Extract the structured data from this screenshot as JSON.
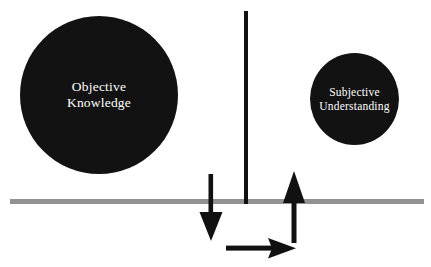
{
  "diagram": {
    "background_color": "#ffffff",
    "nodes": [
      {
        "id": "objective-knowledge",
        "label_line1": "Objective",
        "label_line2": "Knowledge",
        "shape": "circle",
        "fill_color": "#121212",
        "text_color": "#ffffff",
        "center_x": 99,
        "center_y": 95,
        "diameter": 158
      },
      {
        "id": "subjective-understanding",
        "label_line1": "Subjective",
        "label_line2": "Understanding",
        "shape": "circle",
        "fill_color": "#121212",
        "text_color": "#ffffff",
        "center_x": 354,
        "center_y": 99,
        "diameter": 90
      }
    ],
    "ground_line": {
      "name": "horizontal-boundary-line",
      "color": "#929292",
      "x_start": 10,
      "x_end": 424,
      "y": 201,
      "thickness": 5
    },
    "barrier": {
      "name": "vertical-divider-bar",
      "color": "#111111",
      "x": 246,
      "y_top": 11,
      "y_bottom": 204,
      "thickness": 4
    },
    "arrows": [
      {
        "id": "arrow-down",
        "direction": "down",
        "color": "#111111",
        "tail_x": 211,
        "tail_y": 174,
        "tip_x": 211,
        "tip_y": 241
      },
      {
        "id": "arrow-up",
        "direction": "up",
        "color": "#111111",
        "tail_x": 294,
        "tail_y": 243,
        "tip_x": 294,
        "tip_y": 171
      },
      {
        "id": "arrow-right",
        "direction": "right",
        "color": "#111111",
        "tail_x": 226,
        "tail_y": 248,
        "tip_x": 296,
        "tip_y": 248
      }
    ]
  }
}
